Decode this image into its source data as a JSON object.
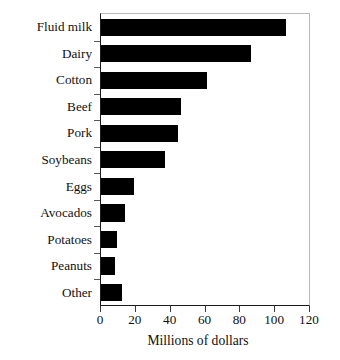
{
  "chart_data": {
    "type": "bar",
    "orientation": "horizontal",
    "title": "",
    "subtitle": "",
    "xlabel": "Millions of dollars",
    "ylabel": "",
    "categories": [
      "Fluid milk",
      "Dairy",
      "Cotton",
      "Beef",
      "Pork",
      "Soybeans",
      "Eggs",
      "Avocados",
      "Potatoes",
      "Peanuts",
      "Other"
    ],
    "values": [
      106,
      86,
      61,
      46,
      44,
      37,
      19,
      14,
      9,
      8,
      12
    ],
    "xlim": [
      0,
      120
    ],
    "xticks": [
      0,
      20,
      40,
      60,
      80,
      100,
      120
    ],
    "xtick_labels": [
      "0",
      "20",
      "40",
      "60",
      "80",
      "100",
      "120"
    ],
    "grid": false,
    "legend": false,
    "bar_color": "#000000",
    "axis_color": "#1a1a1a",
    "frame_color": "#b9b9b9",
    "background": "#ffffff"
  }
}
